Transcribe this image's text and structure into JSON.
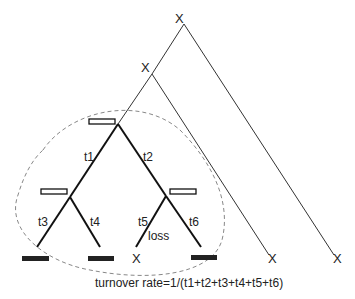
{
  "diagram": {
    "type": "gene-tree-turnover",
    "colors": {
      "line": "#222222",
      "dashed": "#888888",
      "background": "#ffffff"
    },
    "nodes": [
      {
        "id": "root-x",
        "label": "X",
        "note": "lost lineage marker at top root"
      },
      {
        "id": "mid-x",
        "label": "X",
        "note": "lost lineage marker at second node"
      },
      {
        "id": "inner-root",
        "marker": "open-rectangle"
      },
      {
        "id": "left-child",
        "marker": "open-rectangle"
      },
      {
        "id": "right-child",
        "marker": "open-rectangle"
      }
    ],
    "branch_labels": {
      "t1": "t1",
      "t2": "t2",
      "t3": "t3",
      "t4": "t4",
      "t5": "t5",
      "t6": "t6",
      "loss": "loss"
    },
    "leaves": [
      {
        "marker": "filled-rectangle"
      },
      {
        "marker": "filled-rectangle"
      },
      {
        "marker": "X",
        "label": "X"
      },
      {
        "marker": "filled-rectangle"
      },
      {
        "marker": "X",
        "label": "X"
      },
      {
        "marker": "X",
        "label": "X"
      }
    ],
    "caption": "turnover rate=1/(t1+t2+t3+t4+t5+t6)"
  }
}
